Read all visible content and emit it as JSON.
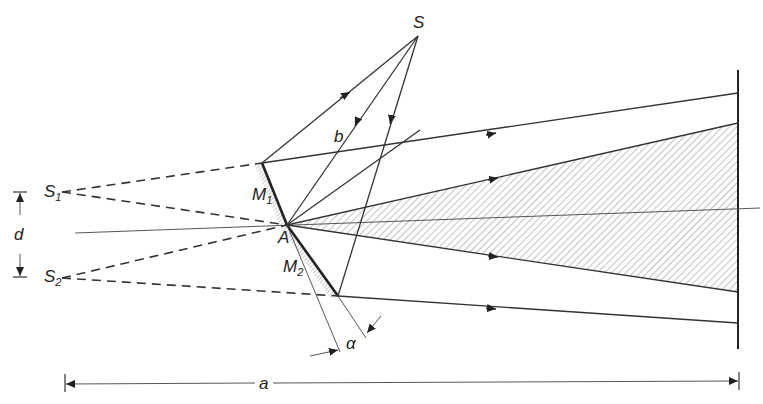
{
  "diagram": {
    "labels": {
      "source": "S",
      "virtual_source_1": "S",
      "virtual_source_1_sub": "1",
      "virtual_source_2": "S",
      "virtual_source_2_sub": "2",
      "mirror_1": "M",
      "mirror_1_sub": "1",
      "mirror_2": "M",
      "mirror_2_sub": "2",
      "apex": "A",
      "distance_b": "b",
      "separation_d": "d",
      "angle": "α",
      "distance_a": "a"
    },
    "points": {
      "S": [
        418,
        36
      ],
      "S1": [
        62,
        192
      ],
      "S2": [
        62,
        278
      ],
      "A": [
        287,
        225
      ],
      "M1_top": [
        262,
        163
      ],
      "M2_bottom": [
        338,
        296
      ]
    },
    "screen_x": 738,
    "colors": {
      "line": "#333333",
      "hatch": "#555555",
      "background": "#ffffff"
    }
  }
}
